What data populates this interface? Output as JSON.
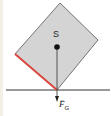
{
  "diagram": {
    "type": "physics-free-body",
    "labels": {
      "center_of_mass": "S",
      "force_symbol": "F",
      "force_subscript": "G",
      "vector_mark": "→"
    },
    "colors": {
      "block_fill": "#d4d4d4",
      "block_stroke": "#555555",
      "highlight_edge": "#d9473f",
      "ground_line": "#333333",
      "force_line": "#333333",
      "center_dot": "#111111"
    },
    "geometry": {
      "block_vertices": [
        [
          60,
          3
        ],
        [
          98,
          40
        ],
        [
          57,
          90
        ],
        [
          15,
          54
        ]
      ],
      "highlight_edge": [
        [
          15,
          54
        ],
        [
          57,
          90
        ]
      ],
      "ground_y": 90,
      "center_of_mass": [
        57,
        47
      ],
      "force_vector": [
        [
          57,
          47
        ],
        [
          57,
          101
        ]
      ]
    }
  }
}
